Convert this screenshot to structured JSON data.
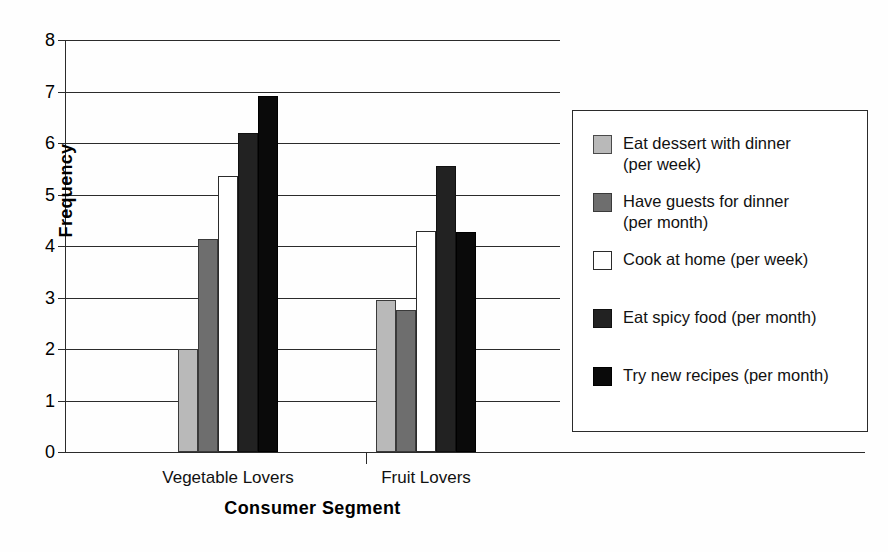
{
  "chart_data": {
    "type": "bar",
    "title": "",
    "xlabel": "Consumer Segment",
    "ylabel": "Frequency",
    "categories": [
      "Vegetable Lovers",
      "Fruit Lovers"
    ],
    "ylim": [
      0,
      8
    ],
    "ytick_labels": [
      "0",
      "1",
      "2",
      "3",
      "4",
      "5",
      "6",
      "7",
      "8"
    ],
    "yticks": [
      0,
      1,
      2,
      3,
      4,
      5,
      6,
      7,
      8
    ],
    "grid": "horizontal",
    "legend_position": "right",
    "series": [
      {
        "name": "Eat dessert with dinner\n(per week)",
        "legend_label": "Eat dessert with dinner\n(per week)",
        "color": "#b9b9b9",
        "values": [
          2.0,
          2.95
        ]
      },
      {
        "name": "Have guests for dinner\n(per month)",
        "legend_label": "Have guests for dinner\n(per month)",
        "color": "#6e6e6e",
        "values": [
          4.13,
          2.75
        ]
      },
      {
        "name": "Cook at home (per week)",
        "legend_label": "Cook at home (per week)",
        "color": "#ffffff",
        "values": [
          5.35,
          4.3
        ]
      },
      {
        "name": "Eat spicy food (per month)",
        "legend_label": "Eat spicy food (per month)",
        "color": "#222222",
        "values": [
          6.2,
          5.55
        ]
      },
      {
        "name": "Try new recipes (per month)",
        "legend_label": "Try new recipes (per month)",
        "color": "#0a0a0a",
        "values": [
          6.92,
          4.28
        ]
      }
    ]
  },
  "axes": {
    "y_title": "Frequency",
    "x_title": "Consumer Segment"
  },
  "legend": {
    "items": [
      {
        "label": "Eat dessert with dinner\n(per week)",
        "swatch": "legend-swatch-eat-dessert"
      },
      {
        "label": "Have guests for dinner\n(per month)",
        "swatch": "legend-swatch-have-guests"
      },
      {
        "label": "Cook at home (per week)",
        "swatch": "legend-swatch-cook-at-home"
      },
      {
        "label": "Eat spicy food (per month)",
        "swatch": "legend-swatch-eat-spicy"
      },
      {
        "label": "Try new recipes (per month)",
        "swatch": "legend-swatch-try-recipes"
      }
    ]
  }
}
